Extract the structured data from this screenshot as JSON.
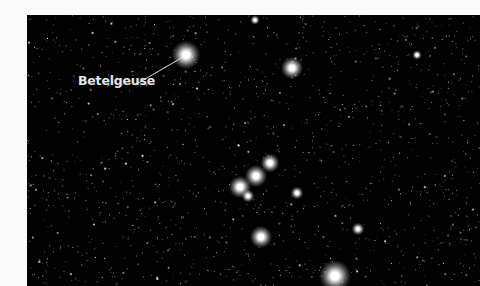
{
  "image": {
    "subject": "Orion constellation star field",
    "background_color": "#020202",
    "page_color": "#fafafa"
  },
  "annotations": [
    {
      "label": "Betelgeuse",
      "label_pos": [
        78,
        85
      ],
      "line_from": [
        135,
        85
      ],
      "line_to": [
        183,
        57
      ],
      "target_star": "betelgeuse"
    }
  ],
  "bright_stars": [
    {
      "name": "betelgeuse",
      "x": 186,
      "y": 55,
      "r": 9
    },
    {
      "name": "bellatrix",
      "x": 292,
      "y": 68,
      "r": 7
    },
    {
      "name": "belt-alnitak",
      "x": 240,
      "y": 187,
      "r": 7
    },
    {
      "name": "belt-alnilam",
      "x": 256,
      "y": 176,
      "r": 7
    },
    {
      "name": "belt-mintaka",
      "x": 270,
      "y": 163,
      "r": 6
    },
    {
      "name": "belt-companion",
      "x": 248,
      "y": 196,
      "r": 4
    },
    {
      "name": "sword-star",
      "x": 297,
      "y": 193,
      "r": 4
    },
    {
      "name": "orion-nebula",
      "x": 261,
      "y": 237,
      "r": 7
    },
    {
      "name": "rigel",
      "x": 335,
      "y": 276,
      "r": 10
    },
    {
      "name": "star-right-1",
      "x": 358,
      "y": 229,
      "r": 4
    },
    {
      "name": "star-top",
      "x": 255,
      "y": 20,
      "r": 3
    },
    {
      "name": "star-far-right",
      "x": 417,
      "y": 55,
      "r": 3
    }
  ]
}
